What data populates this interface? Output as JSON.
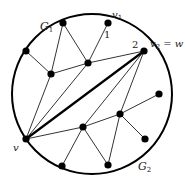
{
  "diagram": {
    "title": "",
    "circle": {
      "cx": 92,
      "cy": 94,
      "r": 80,
      "stroke": "#000000"
    },
    "labels": {
      "G1": {
        "main": "G",
        "sub": "1",
        "x": 40,
        "y": 30
      },
      "G2": {
        "main": "G",
        "sub": "2",
        "x": 138,
        "y": 170
      },
      "v": {
        "text": "v",
        "x": 13,
        "y": 151
      },
      "v1": {
        "main": "v",
        "sub": "1",
        "x": 112,
        "y": 18
      },
      "v2w": {
        "main": "v",
        "sub": "2",
        "suffix": " = w",
        "x": 150,
        "y": 47
      },
      "one": {
        "text": "1",
        "x": 104,
        "y": 38
      },
      "two": {
        "text": "2",
        "x": 132,
        "y": 48
      }
    },
    "nodes": [
      {
        "id": "top",
        "x": 63,
        "y": 23
      },
      {
        "id": "v1",
        "x": 108,
        "y": 23
      },
      {
        "id": "v2",
        "x": 144,
        "y": 51
      },
      {
        "id": "leftUpper",
        "x": 26,
        "y": 51
      },
      {
        "id": "A",
        "x": 51,
        "y": 74
      },
      {
        "id": "B",
        "x": 88,
        "y": 63
      },
      {
        "id": "v",
        "x": 26,
        "y": 139
      },
      {
        "id": "right",
        "x": 159,
        "y": 94
      },
      {
        "id": "C",
        "x": 83,
        "y": 127
      },
      {
        "id": "D",
        "x": 120,
        "y": 114
      },
      {
        "id": "bottomLeft",
        "x": 62,
        "y": 166
      },
      {
        "id": "bottomRight",
        "x": 108,
        "y": 165
      },
      {
        "id": "rightLower",
        "x": 145,
        "y": 139
      }
    ],
    "edges": [
      {
        "from": "top",
        "to": "A"
      },
      {
        "from": "top",
        "to": "B"
      },
      {
        "from": "v1",
        "to": "B"
      },
      {
        "from": "leftUpper",
        "to": "A"
      },
      {
        "from": "A",
        "to": "B"
      },
      {
        "from": "B",
        "to": "v2"
      },
      {
        "from": "A",
        "to": "v"
      },
      {
        "from": "v",
        "to": "B"
      },
      {
        "from": "v",
        "to": "v2",
        "thick": true
      },
      {
        "from": "v",
        "to": "C"
      },
      {
        "from": "v2",
        "to": "C"
      },
      {
        "from": "v2",
        "to": "D"
      },
      {
        "from": "C",
        "to": "D"
      },
      {
        "from": "D",
        "to": "right"
      },
      {
        "from": "C",
        "to": "bottomLeft"
      },
      {
        "from": "C",
        "to": "bottomRight"
      },
      {
        "from": "D",
        "to": "bottomRight"
      },
      {
        "from": "D",
        "to": "rightLower"
      }
    ]
  }
}
